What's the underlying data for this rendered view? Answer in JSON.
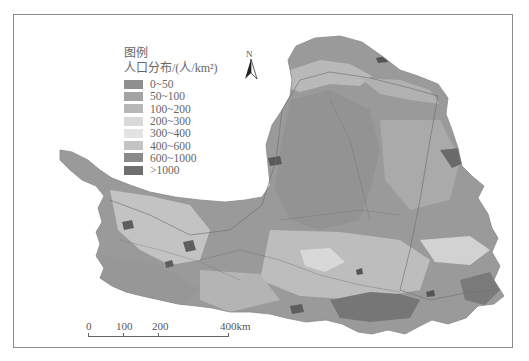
{
  "figure": {
    "type": "choropleth-map"
  },
  "legend": {
    "title": "图例",
    "subtitle": "人口分布/(人/km²)",
    "classes": [
      {
        "label": "0~50",
        "color": "#8f8f8f"
      },
      {
        "label": "50~100",
        "color": "#a3a3a3"
      },
      {
        "label": "100~200",
        "color": "#b7b7b7"
      },
      {
        "label": "200~300",
        "color": "#d9d9d9"
      },
      {
        "label": "300~400",
        "color": "#e3e3e3"
      },
      {
        "label": "400~600",
        "color": "#c4c4c4"
      },
      {
        "label": "600~1000",
        "color": "#8a8a8a"
      },
      {
        "label": ">1000",
        "color": "#6e6e6e"
      }
    ]
  },
  "north_arrow": {
    "label": "N"
  },
  "scale_bar": {
    "unit": "km",
    "ticks": [
      "0",
      "100",
      "200",
      "400km"
    ]
  },
  "colors": {
    "frame": "#8a8a8a",
    "boundary": "#6f6f6f",
    "background": "#ffffff"
  }
}
